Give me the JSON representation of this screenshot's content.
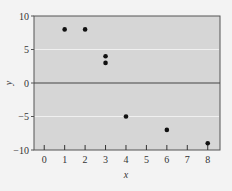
{
  "chart_data": {
    "type": "scatter",
    "title": "",
    "xlabel": "x",
    "ylabel": "y",
    "xlim": [
      -0.5,
      8.6
    ],
    "ylim": [
      -10,
      10
    ],
    "x_ticks": [
      0,
      1,
      2,
      3,
      4,
      5,
      6,
      7,
      8
    ],
    "y_ticks": [
      10,
      5,
      0,
      -5,
      -10
    ],
    "y_tick_labels": [
      "10",
      "5",
      "0",
      "−5",
      "−10"
    ],
    "grid": "horizontal at y=5 and y=-5 (white lines)",
    "zero_line": true,
    "legend": null,
    "points": [
      {
        "x": 1,
        "y": 8
      },
      {
        "x": 2,
        "y": 8
      },
      {
        "x": 3,
        "y": 4
      },
      {
        "x": 3,
        "y": 3
      },
      {
        "x": 4,
        "y": -5
      },
      {
        "x": 6,
        "y": -7
      },
      {
        "x": 8,
        "y": -9
      }
    ],
    "colors": {
      "plot_background": "#d6d6d6",
      "page_background": "#f3f3f3",
      "point": "#111111",
      "gridline": "#f0f0f0",
      "zero_line": "#444444"
    }
  }
}
